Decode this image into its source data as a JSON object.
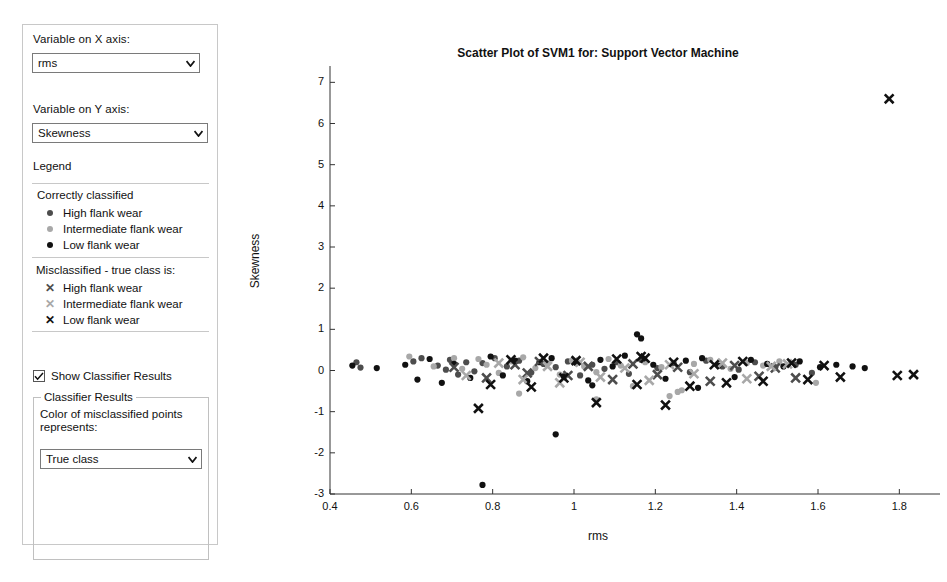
{
  "panel": {
    "x_axis_label": "Variable on X axis:",
    "x_axis_value": "rms",
    "y_axis_label": "Variable on Y axis:",
    "y_axis_value": "Skewness",
    "legend_title": "Legend",
    "legend_correct_title": "Correctly classified",
    "legend_correct": [
      {
        "label": "High flank wear",
        "color": "#4d4d4d",
        "marker": "dot"
      },
      {
        "label": "Intermediate flank wear",
        "color": "#a8a8a8",
        "marker": "dot"
      },
      {
        "label": "Low flank wear",
        "color": "#111111",
        "marker": "dot"
      }
    ],
    "legend_mis_title": "Misclassified - true class is:",
    "legend_mis": [
      {
        "label": "High flank wear",
        "color": "#4d4d4d",
        "marker": "x"
      },
      {
        "label": "Intermediate flank wear",
        "color": "#a8a8a8",
        "marker": "x"
      },
      {
        "label": "Low flank wear",
        "color": "#111111",
        "marker": "x"
      }
    ],
    "show_classifier_results": "Show Classifier Results",
    "show_classifier_checked": true,
    "group_title": "Classifier Results",
    "group_text_line1": "Color of misclassified points",
    "group_text_line2": "represents:",
    "color_select_value": "True class",
    "chevron_icon": "chevron-down-icon",
    "check_icon": "check-icon"
  },
  "chart_data": {
    "type": "scatter",
    "title": "Scatter Plot of SVM1 for: Support Vector Machine",
    "xlabel": "rms",
    "ylabel": "Skewness",
    "xlim": [
      0.4,
      1.9
    ],
    "ylim": [
      -3,
      7.3
    ],
    "xticks": [
      0.4,
      0.6,
      0.8,
      1.0,
      1.2,
      1.4,
      1.6,
      1.8
    ],
    "xticklabels": [
      "0.4",
      "0.6",
      "0.8",
      "1",
      "1.2",
      "1.4",
      "1.6",
      "1.8"
    ],
    "yticks": [
      -3,
      -2,
      -1,
      0,
      1,
      2,
      3,
      4,
      5,
      6,
      7
    ],
    "yticklabels": [
      "-3",
      "-2",
      "-1",
      "0",
      "1",
      "2",
      "3",
      "4",
      "5",
      "6",
      "7"
    ],
    "grid": false,
    "legend_position": "external-left-panel",
    "colors": {
      "high": "#4d4d4d",
      "intermediate": "#a8a8a8",
      "low": "#111111"
    },
    "series": [
      {
        "name": "Correctly classified - High flank wear",
        "marker": "dot",
        "color": "#4d4d4d",
        "points": [
          [
            0.465,
            0.2
          ],
          [
            0.475,
            0.07
          ],
          [
            0.605,
            0.22
          ],
          [
            0.625,
            0.3
          ],
          [
            0.665,
            0.12
          ],
          [
            0.685,
            0.02
          ],
          [
            0.695,
            0.26
          ],
          [
            0.715,
            -0.1
          ],
          [
            0.735,
            0.2
          ],
          [
            0.755,
            -0.02
          ],
          [
            0.775,
            0.18
          ],
          [
            0.805,
            0.3
          ],
          [
            0.835,
            0.1
          ],
          [
            0.865,
            0.24
          ],
          [
            0.895,
            -0.05
          ],
          [
            0.925,
            0.16
          ],
          [
            0.955,
            0.08
          ],
          [
            0.985,
            0.22
          ],
          [
            1.015,
            -0.12
          ],
          [
            1.045,
            0.14
          ],
          [
            1.075,
            0.04
          ],
          [
            1.105,
            0.2
          ],
          [
            1.135,
            -0.08
          ],
          [
            1.165,
            0.26
          ],
          [
            1.205,
            0.06
          ],
          [
            1.245,
            0.18
          ],
          [
            1.285,
            -0.04
          ],
          [
            1.325,
            0.24
          ],
          [
            1.365,
            0.1
          ],
          [
            1.405,
            0.02
          ],
          [
            1.445,
            0.2
          ],
          [
            1.495,
            0.08
          ],
          [
            1.545,
            0.14
          ],
          [
            1.585,
            -0.06
          ]
        ]
      },
      {
        "name": "Correctly classified - Intermediate flank wear",
        "marker": "dot",
        "color": "#a8a8a8",
        "points": [
          [
            0.595,
            0.34
          ],
          [
            0.655,
            0.1
          ],
          [
            0.705,
            0.3
          ],
          [
            0.725,
            0.04
          ],
          [
            0.765,
            0.28
          ],
          [
            0.785,
            0.14
          ],
          [
            0.815,
            -0.06
          ],
          [
            0.845,
            0.22
          ],
          [
            0.875,
            0.32
          ],
          [
            0.905,
            0.06
          ],
          [
            0.935,
            0.18
          ],
          [
            0.965,
            -0.1
          ],
          [
            0.995,
            0.24
          ],
          [
            1.025,
            0.1
          ],
          [
            1.055,
            -0.04
          ],
          [
            1.085,
            0.28
          ],
          [
            1.115,
            0.12
          ],
          [
            1.145,
            -0.38
          ],
          [
            1.175,
            0.2
          ],
          [
            1.215,
            0.08
          ],
          [
            1.255,
            -0.52
          ],
          [
            1.295,
            0.16
          ],
          [
            1.335,
            0.26
          ],
          [
            1.385,
            0.04
          ],
          [
            1.425,
            0.18
          ],
          [
            1.465,
            0.12
          ],
          [
            1.505,
            0.22
          ],
          [
            1.265,
            -0.48
          ],
          [
            1.595,
            -0.3
          ],
          [
            1.235,
            -0.62
          ],
          [
            1.055,
            -0.7
          ],
          [
            0.865,
            -0.56
          ]
        ]
      },
      {
        "name": "Correctly classified - Low flank wear",
        "marker": "dot",
        "color": "#111111",
        "points": [
          [
            0.455,
            0.12
          ],
          [
            0.515,
            0.06
          ],
          [
            0.585,
            0.14
          ],
          [
            0.615,
            -0.22
          ],
          [
            0.645,
            0.28
          ],
          [
            0.675,
            -0.3
          ],
          [
            0.705,
            0.16
          ],
          [
            0.745,
            -0.18
          ],
          [
            0.795,
            0.34
          ],
          [
            0.825,
            -0.12
          ],
          [
            0.855,
            0.24
          ],
          [
            0.885,
            -0.26
          ],
          [
            0.915,
            0.2
          ],
          [
            0.945,
            0.3
          ],
          [
            0.975,
            -0.14
          ],
          [
            1.005,
            0.18
          ],
          [
            1.035,
            -0.24
          ],
          [
            1.065,
            0.26
          ],
          [
            1.095,
            0.1
          ],
          [
            1.125,
            0.36
          ],
          [
            1.155,
            0.88
          ],
          [
            1.165,
            0.78
          ],
          [
            1.195,
            0.14
          ],
          [
            1.225,
            -0.2
          ],
          [
            1.275,
            0.24
          ],
          [
            1.315,
            0.3
          ],
          [
            1.355,
            0.12
          ],
          [
            1.395,
            -0.16
          ],
          [
            1.435,
            0.26
          ],
          [
            1.475,
            0.16
          ],
          [
            1.515,
            0.1
          ],
          [
            1.555,
            0.22
          ],
          [
            1.605,
            0.08
          ],
          [
            1.645,
            0.14
          ],
          [
            1.685,
            0.1
          ],
          [
            1.715,
            0.06
          ],
          [
            0.775,
            -2.78
          ],
          [
            0.955,
            -1.55
          ],
          [
            1.045,
            -0.36
          ],
          [
            1.305,
            -0.42
          ]
        ]
      },
      {
        "name": "Misclassified - true class High flank wear",
        "marker": "x",
        "color": "#4d4d4d",
        "points": [
          [
            0.705,
            0.08
          ],
          [
            0.785,
            -0.18
          ],
          [
            0.855,
            0.14
          ],
          [
            0.885,
            -0.06
          ],
          [
            0.915,
            0.22
          ],
          [
            0.985,
            -0.12
          ],
          [
            1.035,
            0.1
          ],
          [
            1.095,
            -0.22
          ],
          [
            1.145,
            0.16
          ],
          [
            1.205,
            -0.1
          ],
          [
            1.255,
            0.08
          ],
          [
            1.335,
            -0.26
          ],
          [
            1.395,
            0.12
          ],
          [
            1.455,
            -0.14
          ],
          [
            1.495,
            0.06
          ],
          [
            1.545,
            -0.18
          ]
        ]
      },
      {
        "name": "Misclassified - true class Intermediate flank wear",
        "marker": "x",
        "color": "#a8a8a8",
        "points": [
          [
            0.735,
            -0.12
          ],
          [
            0.815,
            0.18
          ],
          [
            0.875,
            -0.22
          ],
          [
            0.935,
            0.1
          ],
          [
            0.965,
            -0.3
          ],
          [
            1.015,
            0.2
          ],
          [
            1.065,
            -0.16
          ],
          [
            1.125,
            0.06
          ],
          [
            1.185,
            -0.24
          ],
          [
            1.235,
            0.14
          ],
          [
            1.295,
            -0.08
          ],
          [
            1.365,
            0.18
          ],
          [
            1.425,
            -0.2
          ],
          [
            1.485,
            0.1
          ],
          [
            1.525,
            0.16
          ]
        ]
      },
      {
        "name": "Misclassified - true class Low flank wear",
        "marker": "x",
        "color": "#111111",
        "points": [
          [
            0.765,
            -0.92
          ],
          [
            0.795,
            -0.34
          ],
          [
            0.845,
            0.26
          ],
          [
            0.895,
            -0.4
          ],
          [
            0.925,
            0.3
          ],
          [
            0.975,
            -0.18
          ],
          [
            1.005,
            0.24
          ],
          [
            1.055,
            -0.78
          ],
          [
            1.105,
            0.28
          ],
          [
            1.155,
            -0.34
          ],
          [
            1.175,
            0.3
          ],
          [
            1.225,
            -0.84
          ],
          [
            1.245,
            0.2
          ],
          [
            1.285,
            -0.38
          ],
          [
            1.345,
            0.14
          ],
          [
            1.375,
            -0.3
          ],
          [
            1.415,
            0.22
          ],
          [
            1.465,
            -0.26
          ],
          [
            1.535,
            0.18
          ],
          [
            1.575,
            -0.22
          ],
          [
            1.615,
            0.12
          ],
          [
            1.655,
            -0.16
          ],
          [
            1.795,
            -0.12
          ],
          [
            1.835,
            -0.1
          ],
          [
            1.775,
            6.6
          ],
          [
            1.165,
            0.34
          ]
        ]
      }
    ]
  }
}
